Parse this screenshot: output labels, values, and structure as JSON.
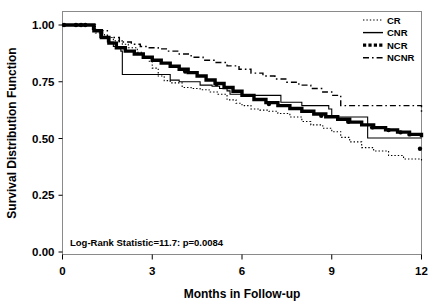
{
  "chart_data": {
    "type": "line",
    "title": "",
    "subtitle": "",
    "xlabel": "Months in Follow-up",
    "ylabel": "Survival Distribution Function",
    "xlim": [
      0,
      12
    ],
    "ylim": [
      0.0,
      1.0
    ],
    "xticks": [
      "0",
      "3",
      "6",
      "9",
      "12"
    ],
    "xtick_values": [
      0,
      3,
      6,
      9,
      12
    ],
    "yticks": [
      "0.00",
      "0.25",
      "0.50",
      "0.75",
      "1.00"
    ],
    "ytick_values": [
      0.0,
      0.25,
      0.5,
      0.75,
      1.0
    ],
    "grid": false,
    "legend_position": "top-right",
    "annotation": "Log-Rank Statistic=11.7: p=0.0084",
    "series": [
      {
        "name": "CR",
        "style": "dotted",
        "x": [
          0,
          0.9,
          1.1,
          1.4,
          1.7,
          2.0,
          2.2,
          2.5,
          2.7,
          2.9,
          3.0,
          3.2,
          3.4,
          3.6,
          4.0,
          4.3,
          4.6,
          4.9,
          5.2,
          5.5,
          5.8,
          6.0,
          6.3,
          6.6,
          6.9,
          7.2,
          7.6,
          8.0,
          8.3,
          8.7,
          9.0,
          9.3,
          9.6,
          10.0,
          10.4,
          10.9,
          11.4,
          12.0
        ],
        "y": [
          1.0,
          1.0,
          0.965,
          0.945,
          0.93,
          0.915,
          0.9,
          0.88,
          0.86,
          0.84,
          0.81,
          0.775,
          0.755,
          0.745,
          0.725,
          0.72,
          0.715,
          0.705,
          0.695,
          0.67,
          0.655,
          0.645,
          0.63,
          0.625,
          0.62,
          0.61,
          0.595,
          0.575,
          0.56,
          0.545,
          0.53,
          0.505,
          0.485,
          0.46,
          0.445,
          0.425,
          0.41,
          0.395
        ]
      },
      {
        "name": "CNR",
        "style": "solid",
        "x": [
          0,
          0.85,
          1.0,
          1.25,
          1.5,
          1.7,
          1.95,
          2.0,
          3.25,
          3.6,
          3.9,
          4.2,
          4.6,
          5.0,
          5.25,
          5.5,
          5.6,
          6.0,
          7.3,
          8.0,
          8.9,
          9.0,
          10.1,
          10.2,
          12.0
        ],
        "y": [
          1.0,
          1.0,
          0.98,
          0.945,
          0.925,
          0.905,
          0.885,
          0.782,
          0.782,
          0.757,
          0.75,
          0.75,
          0.735,
          0.73,
          0.72,
          0.71,
          0.695,
          0.69,
          0.66,
          0.645,
          0.63,
          0.595,
          0.595,
          0.502,
          0.502
        ]
      },
      {
        "name": "NCR",
        "style": "thick",
        "x": [
          0,
          0.9,
          1.05,
          1.3,
          1.55,
          1.8,
          2.1,
          2.4,
          2.7,
          3.0,
          3.3,
          3.6,
          3.9,
          4.2,
          4.5,
          4.8,
          5.1,
          5.4,
          5.7,
          6.0,
          6.4,
          6.8,
          7.2,
          7.6,
          8.0,
          8.4,
          8.8,
          9.2,
          9.6,
          10.0,
          10.4,
          10.8,
          11.2,
          11.6,
          12.0
        ],
        "y": [
          1.0,
          1.0,
          0.975,
          0.945,
          0.92,
          0.9,
          0.885,
          0.872,
          0.858,
          0.845,
          0.832,
          0.818,
          0.805,
          0.79,
          0.775,
          0.758,
          0.742,
          0.725,
          0.708,
          0.69,
          0.672,
          0.658,
          0.645,
          0.632,
          0.62,
          0.608,
          0.596,
          0.585,
          0.572,
          0.56,
          0.548,
          0.538,
          0.528,
          0.518,
          0.505
        ]
      },
      {
        "name": "NCNR",
        "style": "dash-dot",
        "x": [
          0,
          0.9,
          1.1,
          1.5,
          1.9,
          2.3,
          2.6,
          2.9,
          3.2,
          3.5,
          3.9,
          4.3,
          4.7,
          5.1,
          5.5,
          5.9,
          6.3,
          6.7,
          7.1,
          7.5,
          7.9,
          8.3,
          8.7,
          9.0,
          9.3,
          9.35,
          11.7,
          12.0
        ],
        "y": [
          1.0,
          1.0,
          0.975,
          0.945,
          0.925,
          0.915,
          0.905,
          0.9,
          0.895,
          0.885,
          0.872,
          0.858,
          0.845,
          0.835,
          0.82,
          0.805,
          0.788,
          0.775,
          0.762,
          0.748,
          0.735,
          0.72,
          0.705,
          0.69,
          0.645,
          0.645,
          0.645,
          0.612
        ]
      }
    ],
    "censor_marks": [
      {
        "series": "NCR",
        "x": 0.05,
        "y": 1.0
      },
      {
        "series": "NCR",
        "x": 0.45,
        "y": 1.0
      },
      {
        "series": "NCR",
        "x": 0.62,
        "y": 1.0
      },
      {
        "series": "NCR",
        "x": 0.76,
        "y": 1.0
      },
      {
        "series": "NCR",
        "x": 4.1,
        "y": 0.795
      },
      {
        "series": "NCR",
        "x": 5.15,
        "y": 0.74
      },
      {
        "series": "NCR",
        "x": 6.9,
        "y": 0.652
      },
      {
        "series": "NCR",
        "x": 8.65,
        "y": 0.6
      },
      {
        "series": "NCR",
        "x": 9.55,
        "y": 0.574
      },
      {
        "series": "NCR",
        "x": 10.35,
        "y": 0.549
      },
      {
        "series": "NCR",
        "x": 10.9,
        "y": 0.537
      },
      {
        "series": "NCR",
        "x": 11.3,
        "y": 0.527
      },
      {
        "series": "NCR",
        "x": 11.6,
        "y": 0.518
      },
      {
        "series": "CR",
        "x": 11.95,
        "y": 0.455
      }
    ]
  },
  "legend": {
    "entries": [
      {
        "label": "CR",
        "style": "dotted"
      },
      {
        "label": "CNR",
        "style": "solid"
      },
      {
        "label": "NCR",
        "style": "thick-dotted"
      },
      {
        "label": "NCNR",
        "style": "dash-dot"
      }
    ]
  },
  "axes": {
    "x_title": "Months in Follow-up",
    "y_title": "Survival Distribution Function",
    "x_tick_labels": [
      "0",
      "3",
      "6",
      "9",
      "12"
    ],
    "y_tick_labels": [
      "0.00",
      "0.25",
      "0.50",
      "0.75",
      "1.00"
    ]
  },
  "annotation": {
    "text": "Log-Rank Statistic=11.7: p=0.0084"
  },
  "colors": {
    "line": "#000000",
    "frame": "#8a8a8a",
    "background": "#ffffff"
  }
}
